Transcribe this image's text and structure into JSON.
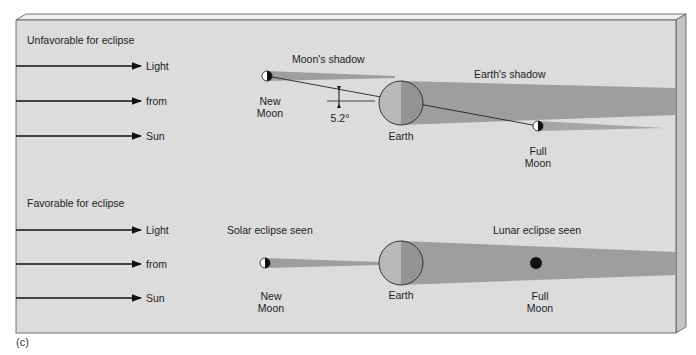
{
  "figure": {
    "tag": "(c)",
    "colors": {
      "panel_face": "#dcdcdc",
      "panel_side": "#c4c4c4",
      "panel_top": "#eeeeee",
      "shadow": "#9e9e9e",
      "earth_lit": "#b9b9b9",
      "earth_dark": "#939393",
      "outline": "#333333"
    }
  },
  "top": {
    "heading": "Unfavorable for eclipse",
    "arrows": [
      "Light",
      "from",
      "Sun"
    ],
    "moon_shadow_label": "Moon's shadow",
    "earth_shadow_label": "Earth's shadow",
    "new_moon_label_1": "New",
    "new_moon_label_2": "Moon",
    "earth_label": "Earth",
    "full_moon_label_1": "Full",
    "full_moon_label_2": "Moon",
    "angle_label": "5.2°"
  },
  "bottom": {
    "heading": "Favorable for eclipse",
    "arrows": [
      "Light",
      "from",
      "Sun"
    ],
    "solar_label": "Solar eclipse seen",
    "lunar_label": "Lunar eclipse seen",
    "new_moon_label_1": "New",
    "new_moon_label_2": "Moon",
    "earth_label": "Earth",
    "full_moon_label_1": "Full",
    "full_moon_label_2": "Moon"
  }
}
